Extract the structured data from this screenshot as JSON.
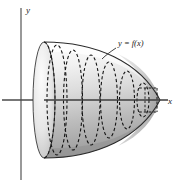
{
  "figure": {
    "background_color": "#ffffff",
    "axes": {
      "x_label": "x",
      "y_label": "y",
      "axis_color": "#4d4d4d",
      "x_axis": {
        "x1": 2,
        "y1": 100,
        "x2": 168,
        "y2": 100
      },
      "y_axis": {
        "x1": 21,
        "y1": 8,
        "x2": 21,
        "y2": 180
      },
      "x_label_pos": {
        "x": 170,
        "y": 104
      },
      "y_label_pos": {
        "x": 25,
        "y": 13
      }
    },
    "curve_label": {
      "text": "y = f(x)",
      "x": 118,
      "y": 45,
      "leader": {
        "x1": 116,
        "y1": 47,
        "x2": 104,
        "y2": 58
      }
    },
    "solid": {
      "description": "paraboloid-like solid of revolution, opening to the left, apex at right",
      "apex_x": 160,
      "base_x": 44,
      "base_center_y": 100,
      "base_semi_height": 58,
      "base_semi_width": 11,
      "outline_color": "#2b2b2b",
      "fill_gradient": {
        "light": "#fbfbfb",
        "mid": "#d9d9d9",
        "dark": "#9a9a9a"
      }
    },
    "disks": {
      "style": "dashed",
      "color": "#1a1a1a",
      "count": 6,
      "items": [
        {
          "name": "disk-1",
          "cx": 57,
          "ry": 55,
          "rx": 10
        },
        {
          "name": "disk-2",
          "cx": 73,
          "ry": 50,
          "rx": 9
        },
        {
          "name": "disk-3",
          "cx": 91,
          "ry": 45,
          "rx": 8.5
        },
        {
          "name": "disk-4",
          "cx": 109,
          "ry": 38,
          "rx": 8
        },
        {
          "name": "disk-5",
          "cx": 127,
          "ry": 29,
          "rx": 7
        },
        {
          "name": "disk-6",
          "cx": 143,
          "ry": 17,
          "rx": 5.5
        }
      ]
    },
    "sample_disk": {
      "name": "representative-disk",
      "x_left": 139,
      "x_right": 155,
      "top_y": 88,
      "bottom_y": 112,
      "radius_tick_x": 145
    }
  }
}
